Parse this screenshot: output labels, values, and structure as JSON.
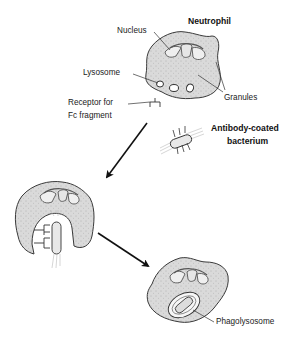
{
  "diagram": {
    "title": "Neutrophil",
    "labels": {
      "nucleus": "Nucleus",
      "lysosome": "Lysosome",
      "receptor_line1": "Receptor for",
      "receptor_line2": "Fc fragment",
      "granules": "Granules",
      "bacterium_line1": "Antibody-coated",
      "bacterium_line2": "bacterium",
      "phagolysosome": "Phagolysosome"
    },
    "stages": [
      {
        "id": "stage-1",
        "description": "Neutrophil with Fc receptor and antibody-coated bacterium"
      },
      {
        "id": "stage-2",
        "description": "Neutrophil engulfing bacterium via Fc receptors"
      },
      {
        "id": "stage-3",
        "description": "Bacterium enclosed in phagolysosome"
      }
    ],
    "colors": {
      "cell_fill": "#d9d9d9",
      "outline": "#3a3a3a",
      "arrow": "#111111",
      "background": "#ffffff",
      "text": "#1a1a1a"
    }
  }
}
